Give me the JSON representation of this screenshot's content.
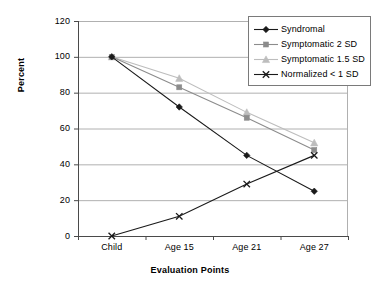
{
  "chart_data": {
    "type": "line",
    "title": "",
    "xlabel": "Evaluation Points",
    "ylabel": "Percent",
    "categories": [
      "Child",
      "Age 15",
      "Age 21",
      "Age 27"
    ],
    "ylim": [
      0,
      120
    ],
    "yticks": [
      0,
      20,
      40,
      60,
      80,
      100,
      120
    ],
    "ytick_labels": [
      "0",
      "20",
      "40",
      "60",
      "80",
      "100",
      "120"
    ],
    "grid": "horizontal",
    "legend_position": "top-right",
    "series": [
      {
        "name": "Syndromal",
        "values": [
          100,
          72,
          45,
          25
        ],
        "color": "#1a1a1a",
        "marker": "diamond"
      },
      {
        "name": "Symptomatic 2 SD",
        "values": [
          100,
          83,
          66,
          48
        ],
        "color": "#8c8c8c",
        "marker": "square"
      },
      {
        "name": "Symptomatic 1.5 SD",
        "values": [
          100,
          88,
          69,
          52
        ],
        "color": "#bdbdbd",
        "marker": "triangle"
      },
      {
        "name": "Normalized < 1 SD",
        "values": [
          0,
          11,
          29,
          45
        ],
        "color": "#1a1a1a",
        "marker": "cross"
      }
    ]
  },
  "legend": {
    "items": [
      {
        "label": "Syndromal"
      },
      {
        "label": "Symptomatic 2 SD"
      },
      {
        "label": "Symptomatic 1.5 SD"
      },
      {
        "label": "Normalized < 1 SD"
      }
    ]
  },
  "axes": {
    "y_title": "Percent",
    "x_title": "Evaluation Points"
  }
}
